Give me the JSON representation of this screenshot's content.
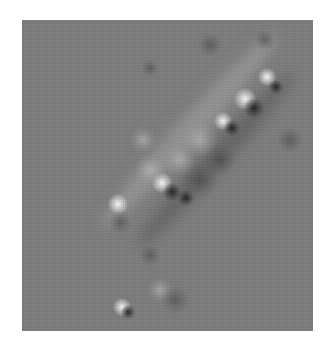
{
  "image": {
    "description": "Grayscale relief-style (high-pass filtered) image showing a diagonal elongated structure from lower-left to upper-right with bright highlights and dark shadow spots",
    "background_color": "#ffffff",
    "panel_color": "#7b7b7b",
    "panel": {
      "x": 22,
      "y": 20,
      "width": 291,
      "height": 311
    }
  },
  "bands": [
    {
      "cx": 190,
      "cy": 130,
      "length": 260,
      "thickness": 26,
      "angle": -48,
      "color": "rgba(175,175,175,0.45)"
    },
    {
      "cx": 205,
      "cy": 150,
      "length": 230,
      "thickness": 22,
      "angle": -48,
      "color": "rgba(60,60,60,0.35)",
      "offset": 14
    }
  ],
  "blobs": [
    {
      "type": "bright",
      "x": 245,
      "y": 99,
      "size": 22
    },
    {
      "type": "bright",
      "x": 267,
      "y": 77,
      "size": 18
    },
    {
      "type": "bright",
      "x": 223,
      "y": 121,
      "size": 18
    },
    {
      "type": "bright",
      "x": 162,
      "y": 183,
      "size": 20
    },
    {
      "type": "bright",
      "x": 118,
      "y": 204,
      "size": 20
    },
    {
      "type": "bright",
      "x": 122,
      "y": 307,
      "size": 18
    },
    {
      "type": "soft-light",
      "x": 143,
      "y": 140,
      "size": 26
    },
    {
      "type": "soft-light",
      "x": 150,
      "y": 170,
      "size": 30
    },
    {
      "type": "soft-light",
      "x": 200,
      "y": 140,
      "size": 34
    },
    {
      "type": "soft-light",
      "x": 180,
      "y": 160,
      "size": 30
    },
    {
      "type": "soft-light",
      "x": 160,
      "y": 290,
      "size": 24
    },
    {
      "type": "dark",
      "x": 254,
      "y": 108,
      "size": 20
    },
    {
      "type": "dark",
      "x": 232,
      "y": 128,
      "size": 16
    },
    {
      "type": "dark",
      "x": 172,
      "y": 192,
      "size": 18
    },
    {
      "type": "dark",
      "x": 186,
      "y": 198,
      "size": 16
    },
    {
      "type": "dark",
      "x": 128,
      "y": 312,
      "size": 14
    },
    {
      "type": "dark",
      "x": 276,
      "y": 87,
      "size": 14
    },
    {
      "type": "soft-dark",
      "x": 210,
      "y": 45,
      "size": 22
    },
    {
      "type": "soft-dark",
      "x": 265,
      "y": 40,
      "size": 20
    },
    {
      "type": "soft-dark",
      "x": 150,
      "y": 68,
      "size": 16
    },
    {
      "type": "soft-dark",
      "x": 120,
      "y": 222,
      "size": 22
    },
    {
      "type": "soft-dark",
      "x": 200,
      "y": 180,
      "size": 34
    },
    {
      "type": "soft-dark",
      "x": 220,
      "y": 160,
      "size": 30
    },
    {
      "type": "soft-dark",
      "x": 175,
      "y": 300,
      "size": 26
    },
    {
      "type": "soft-dark",
      "x": 150,
      "y": 255,
      "size": 20
    },
    {
      "type": "soft-dark",
      "x": 290,
      "y": 140,
      "size": 24
    }
  ]
}
